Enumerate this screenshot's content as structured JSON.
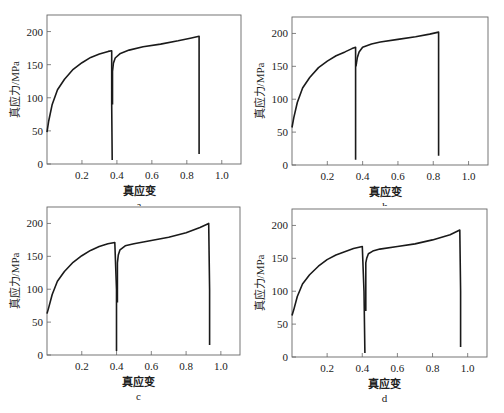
{
  "figure": {
    "xlabel": "真应变",
    "ylabel": "真应力/MPa"
  },
  "chart_data": [
    {
      "panel": "a",
      "type": "line",
      "xlabel": "真应变",
      "ylabel": "真应力/MPa",
      "xlim": [
        0,
        1.11
      ],
      "ylim": [
        0,
        225
      ],
      "xticks": [
        0.2,
        0.4,
        0.6,
        0.8,
        1.0
      ],
      "xtick_labels": [
        "0.2",
        "0.4",
        "0.6",
        "0.8",
        "1.0"
      ],
      "yticks": [
        0,
        50,
        100,
        150,
        200
      ],
      "ytick_labels": [
        "0",
        "50",
        "100",
        "150",
        "200"
      ],
      "grid": false,
      "series": [
        {
          "name": "pass 1",
          "x": [
            0.0,
            0.01,
            0.03,
            0.06,
            0.1,
            0.15,
            0.2,
            0.25,
            0.3,
            0.35,
            0.37,
            0.37,
            0.373
          ],
          "y": [
            48,
            65,
            90,
            112,
            128,
            143,
            153,
            161,
            166,
            170,
            171,
            90,
            6
          ]
        },
        {
          "name": "pass 2",
          "x": [
            0.375,
            0.375,
            0.38,
            0.39,
            0.42,
            0.47,
            0.55,
            0.65,
            0.75,
            0.82,
            0.87,
            0.87,
            0.87
          ],
          "y": [
            90,
            140,
            152,
            160,
            167,
            172,
            177,
            181,
            186,
            190,
            193,
            100,
            15
          ]
        }
      ]
    },
    {
      "panel": "b",
      "type": "line",
      "xlabel": "真应变",
      "ylabel": "真应力/MPa",
      "xlim": [
        0,
        1.11
      ],
      "ylim": [
        0,
        225
      ],
      "xticks": [
        0.2,
        0.4,
        0.6,
        0.8,
        1.0
      ],
      "xtick_labels": [
        "0.2",
        "0.4",
        "0.6",
        "0.8",
        "1.0"
      ],
      "yticks": [
        0,
        50,
        100,
        150,
        200
      ],
      "ytick_labels": [
        "0",
        "50",
        "100",
        "150",
        "200"
      ],
      "grid": false,
      "series": [
        {
          "name": "pass 1",
          "x": [
            0.0,
            0.01,
            0.03,
            0.06,
            0.1,
            0.15,
            0.2,
            0.25,
            0.3,
            0.34,
            0.36,
            0.36,
            0.36
          ],
          "y": [
            57,
            72,
            95,
            117,
            133,
            148,
            158,
            166,
            172,
            177,
            179,
            100,
            8
          ]
        },
        {
          "name": "pass 2",
          "x": [
            0.362,
            0.365,
            0.37,
            0.38,
            0.4,
            0.45,
            0.5,
            0.6,
            0.7,
            0.78,
            0.83,
            0.83,
            0.83
          ],
          "y": [
            150,
            155,
            163,
            172,
            179,
            184,
            187,
            191,
            195,
            199,
            202,
            100,
            14
          ]
        }
      ]
    },
    {
      "panel": "c",
      "type": "line",
      "xlabel": "真应变",
      "ylabel": "真应力/MPa",
      "xlim": [
        0,
        1.11
      ],
      "ylim": [
        0,
        225
      ],
      "xticks": [
        0.2,
        0.4,
        0.6,
        0.8,
        1.0
      ],
      "xtick_labels": [
        "0.2",
        "0.4",
        "0.6",
        "0.8",
        "1.0"
      ],
      "yticks": [
        0,
        50,
        100,
        150,
        200
      ],
      "ytick_labels": [
        "0",
        "50",
        "100",
        "150",
        "200"
      ],
      "grid": false,
      "series": [
        {
          "name": "pass 1",
          "x": [
            0.0,
            0.01,
            0.03,
            0.06,
            0.1,
            0.15,
            0.2,
            0.25,
            0.3,
            0.35,
            0.39,
            0.4,
            0.4
          ],
          "y": [
            63,
            72,
            92,
            112,
            127,
            141,
            151,
            159,
            165,
            169,
            171,
            100,
            6
          ]
        },
        {
          "name": "pass 2",
          "x": [
            0.405,
            0.405,
            0.41,
            0.42,
            0.45,
            0.5,
            0.6,
            0.7,
            0.8,
            0.88,
            0.93,
            0.935,
            0.935
          ],
          "y": [
            80,
            140,
            152,
            160,
            166,
            169,
            174,
            179,
            186,
            194,
            200,
            100,
            15
          ]
        }
      ]
    },
    {
      "panel": "d",
      "type": "line",
      "xlabel": "真应变",
      "ylabel": "真应力/MPa",
      "xlim": [
        0,
        1.11
      ],
      "ylim": [
        0,
        225
      ],
      "xticks": [
        0.2,
        0.4,
        0.6,
        0.8,
        1.0
      ],
      "xtick_labels": [
        "0.2",
        "0.4",
        "0.6",
        "0.8",
        "1.0"
      ],
      "yticks": [
        0,
        50,
        100,
        150,
        200
      ],
      "ytick_labels": [
        "0",
        "50",
        "100",
        "150",
        "200"
      ],
      "grid": false,
      "series": [
        {
          "name": "pass 1",
          "x": [
            0.0,
            0.01,
            0.03,
            0.06,
            0.1,
            0.15,
            0.2,
            0.25,
            0.3,
            0.35,
            0.4,
            0.41,
            0.415
          ],
          "y": [
            63,
            72,
            92,
            111,
            125,
            138,
            148,
            155,
            160,
            165,
            168,
            100,
            6
          ]
        },
        {
          "name": "pass 2",
          "x": [
            0.42,
            0.42,
            0.425,
            0.435,
            0.46,
            0.5,
            0.6,
            0.7,
            0.8,
            0.9,
            0.955,
            0.96,
            0.96
          ],
          "y": [
            70,
            143,
            150,
            157,
            161,
            164,
            168,
            172,
            178,
            186,
            193,
            100,
            15
          ]
        }
      ]
    }
  ],
  "panels": [
    {
      "caption": "a"
    },
    {
      "caption": "b"
    },
    {
      "caption": "c"
    },
    {
      "caption": "d"
    }
  ]
}
